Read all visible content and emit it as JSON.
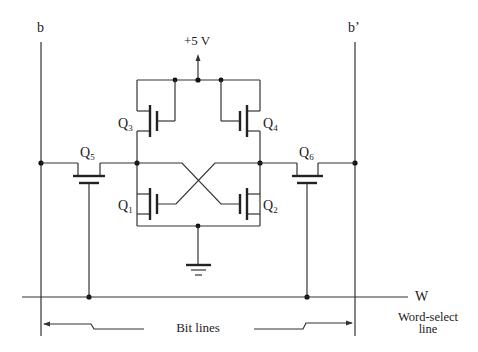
{
  "diagram": {
    "supply_label": "+5 V",
    "bit_line_left_label": "b",
    "bit_line_right_label": "b’",
    "word_line_label": "W",
    "word_select_label_line1": "Word-select",
    "word_select_label_line2": "line",
    "bit_lines_label": "Bit lines",
    "transistors": [
      {
        "id": "Q1",
        "base": "Q",
        "sub": "1",
        "role": "pull-down left"
      },
      {
        "id": "Q2",
        "base": "Q",
        "sub": "2",
        "role": "pull-down right"
      },
      {
        "id": "Q3",
        "base": "Q",
        "sub": "3",
        "role": "load left"
      },
      {
        "id": "Q4",
        "base": "Q",
        "sub": "4",
        "role": "load right"
      },
      {
        "id": "Q5",
        "base": "Q",
        "sub": "5",
        "role": "access left"
      },
      {
        "id": "Q6",
        "base": "Q",
        "sub": "6",
        "role": "access right"
      }
    ],
    "colors": {
      "line": "#333333",
      "background": "#ffffff"
    }
  }
}
